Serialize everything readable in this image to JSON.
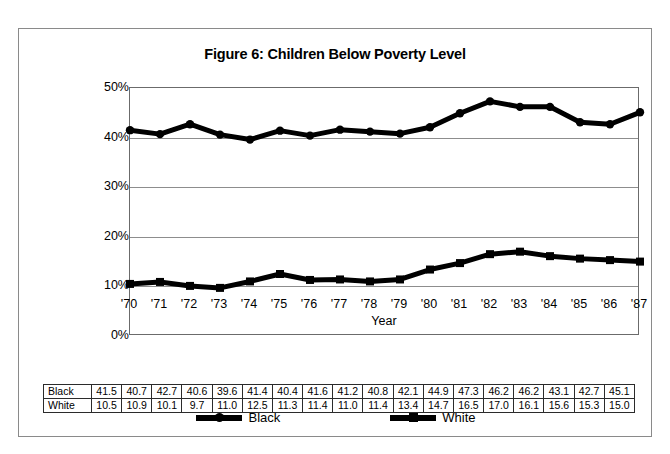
{
  "figure": {
    "title": "Figure 6:  Children Below Poverty Level"
  },
  "chart_data": {
    "type": "line",
    "title": "Figure 6:  Children Below Poverty Level",
    "xlabel": "Year",
    "ylabel": "",
    "ylim": [
      0,
      50
    ],
    "yticks": [
      0,
      10,
      20,
      30,
      40,
      50
    ],
    "ytick_labels": [
      "0%",
      "10%",
      "20%",
      "30%",
      "40%",
      "50%"
    ],
    "grid": true,
    "legend_position": "bottom",
    "categories": [
      "'70",
      "'71",
      "'72",
      "'73",
      "'74",
      "'75",
      "'76",
      "'77",
      "'78",
      "'79",
      "'80",
      "'81",
      "'82",
      "'83",
      "'84",
      "'85",
      "'86",
      "'87"
    ],
    "series": [
      {
        "name": "Black",
        "marker": "circle",
        "color": "#000000",
        "values": [
          41.5,
          40.7,
          42.7,
          40.6,
          39.6,
          41.4,
          40.4,
          41.6,
          41.2,
          40.8,
          42.1,
          44.9,
          47.3,
          46.2,
          46.2,
          43.1,
          42.7,
          45.1
        ]
      },
      {
        "name": "White",
        "marker": "square",
        "color": "#000000",
        "values": [
          10.5,
          10.9,
          10.1,
          9.7,
          11.0,
          12.5,
          11.3,
          11.4,
          11.0,
          11.4,
          13.4,
          14.7,
          16.5,
          17.0,
          16.1,
          15.6,
          15.3,
          15.0
        ]
      }
    ]
  },
  "legend": {
    "items": [
      {
        "label": "Black",
        "marker": "circle"
      },
      {
        "label": "White",
        "marker": "square"
      }
    ]
  },
  "table": {
    "rows": [
      {
        "label": "Black",
        "values": [
          "41.5",
          "40.7",
          "42.7",
          "40.6",
          "39.6",
          "41.4",
          "40.4",
          "41.6",
          "41.2",
          "40.8",
          "42.1",
          "44.9",
          "47.3",
          "46.2",
          "46.2",
          "43.1",
          "42.7",
          "45.1"
        ]
      },
      {
        "label": "White",
        "values": [
          "10.5",
          "10.9",
          "10.1",
          "9.7",
          "11.0",
          "12.5",
          "11.3",
          "11.4",
          "11.0",
          "11.4",
          "13.4",
          "14.7",
          "16.5",
          "17.0",
          "16.1",
          "15.6",
          "15.3",
          "15.0"
        ]
      }
    ]
  }
}
